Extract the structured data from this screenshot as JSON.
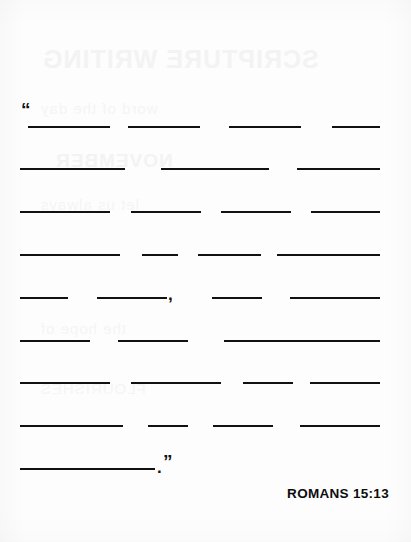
{
  "document": {
    "type": "fill-in-the-blank scripture memory worksheet",
    "background_color": "#fdfdfd",
    "ink_color": "#111111"
  },
  "quotation": {
    "open_quote": "“",
    "close_quote": "”",
    "mid_comma": ",",
    "end_period": "."
  },
  "citation": {
    "text": "ROMANS 15:13"
  },
  "showthrough": {
    "title": "SCRIPTURE WRITING",
    "subtitle": "NOVEMBER",
    "lines": [
      "word of the day",
      "let us always",
      "the hope of",
      "FLOURISHES"
    ]
  },
  "blank_rows": [
    {
      "id": "row-1",
      "top": 108,
      "blanks": [
        {
          "left": 28,
          "width": 82
        },
        {
          "left": 128,
          "width": 72
        },
        {
          "left": 229,
          "width": 72
        },
        {
          "left": 332,
          "width": 48
        }
      ],
      "punctuation": []
    },
    {
      "id": "row-2",
      "top": 150,
      "blanks": [
        {
          "left": 20,
          "width": 105
        },
        {
          "left": 161,
          "width": 108
        },
        {
          "left": 297,
          "width": 83
        }
      ],
      "punctuation": []
    },
    {
      "id": "row-3",
      "top": 193,
      "blanks": [
        {
          "left": 20,
          "width": 90
        },
        {
          "left": 131,
          "width": 70
        },
        {
          "left": 221,
          "width": 70
        },
        {
          "left": 311,
          "width": 69
        }
      ],
      "punctuation": []
    },
    {
      "id": "row-4",
      "top": 236,
      "blanks": [
        {
          "left": 20,
          "width": 100
        },
        {
          "left": 142,
          "width": 36
        },
        {
          "left": 198,
          "width": 63
        },
        {
          "left": 277,
          "width": 103
        }
      ],
      "punctuation": []
    },
    {
      "id": "row-5",
      "top": 279,
      "blanks": [
        {
          "left": 20,
          "width": 48
        },
        {
          "left": 97,
          "width": 70
        },
        {
          "left": 212,
          "width": 50
        },
        {
          "left": 290,
          "width": 90
        }
      ],
      "punctuation": [
        {
          "glyph": ",",
          "left": 168
        }
      ]
    },
    {
      "id": "row-6",
      "top": 322,
      "blanks": [
        {
          "left": 20,
          "width": 70
        },
        {
          "left": 118,
          "width": 70
        },
        {
          "left": 224,
          "width": 156
        }
      ],
      "punctuation": []
    },
    {
      "id": "row-7",
      "top": 364,
      "blanks": [
        {
          "left": 20,
          "width": 90
        },
        {
          "left": 131,
          "width": 90
        },
        {
          "left": 243,
          "width": 50
        },
        {
          "left": 310,
          "width": 70
        }
      ],
      "punctuation": []
    },
    {
      "id": "row-8",
      "top": 407,
      "blanks": [
        {
          "left": 20,
          "width": 103
        },
        {
          "left": 148,
          "width": 40
        },
        {
          "left": 213,
          "width": 60
        },
        {
          "left": 300,
          "width": 80
        }
      ],
      "punctuation": []
    },
    {
      "id": "row-9",
      "top": 450,
      "blanks": [
        {
          "left": 20,
          "width": 135
        }
      ],
      "punctuation": []
    }
  ]
}
